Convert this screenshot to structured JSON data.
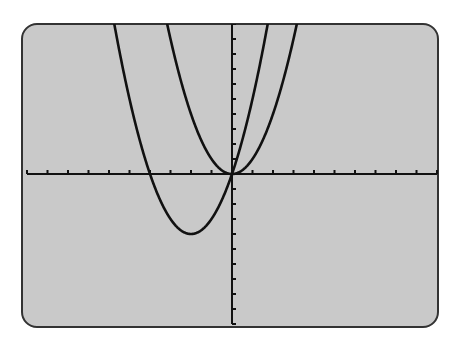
{
  "chart_data": {
    "type": "line",
    "title": "",
    "xlabel": "",
    "ylabel": "",
    "xlim": [
      -10,
      10
    ],
    "ylim": [
      -10,
      10
    ],
    "xscale": 1,
    "yscale": 1,
    "grid": false,
    "legend": null,
    "series": [
      {
        "name": "y = x^2",
        "a": 1,
        "b": 0,
        "c": 0,
        "vertex": [
          0,
          0
        ],
        "roots": [
          0
        ]
      },
      {
        "name": "y = x^2 + 4x",
        "a": 1,
        "b": 4,
        "c": 0,
        "vertex": [
          -2,
          -4
        ],
        "roots": [
          -4,
          0
        ]
      }
    ]
  },
  "screen": {
    "background": "#c9c9c9",
    "border_color": "#333333",
    "curve_color": "#111111",
    "axis_color": "#111111"
  }
}
